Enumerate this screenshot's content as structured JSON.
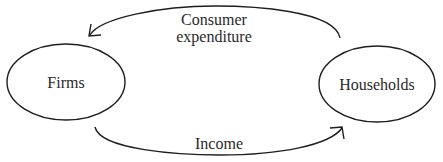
{
  "diagram": {
    "type": "circular-flow",
    "nodes": [
      {
        "id": "firms",
        "label": "Firms"
      },
      {
        "id": "households",
        "label": "Households"
      }
    ],
    "edges": [
      {
        "from": "households",
        "to": "firms",
        "label_line1": "Consumer",
        "label_line2": "expenditure"
      },
      {
        "from": "firms",
        "to": "households",
        "label": "Income"
      }
    ],
    "colors": {
      "stroke": "#1e1e1e",
      "text": "#2a2a2a",
      "background": "#ffffff"
    }
  }
}
